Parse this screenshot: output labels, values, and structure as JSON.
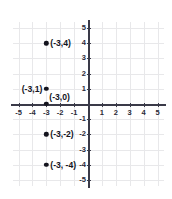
{
  "chart_data": {
    "type": "scatter",
    "title": "",
    "xlabel": "",
    "ylabel": "",
    "xlim": [
      -5,
      5
    ],
    "ylim": [
      -5,
      5
    ],
    "grid": true,
    "legend": null,
    "x_ticks": [
      "-5",
      "-4",
      "-3",
      "-2",
      "-1",
      "1",
      "2",
      "3",
      "4",
      "5"
    ],
    "x_tick_values": [
      -5,
      -4,
      -3,
      -2,
      -1,
      1,
      2,
      3,
      4,
      5
    ],
    "y_ticks": [
      "5",
      "4",
      "3",
      "2",
      "1",
      "-1",
      "-2",
      "-3",
      "-4",
      "-5"
    ],
    "y_tick_values": [
      5,
      4,
      3,
      2,
      1,
      -1,
      -2,
      -3,
      -4,
      -5
    ],
    "points": [
      {
        "x": -3,
        "y": 4,
        "label": "(-3,4)",
        "label_side": "right"
      },
      {
        "x": -3,
        "y": 1,
        "label": "(-3,1)",
        "label_side": "left"
      },
      {
        "x": -3,
        "y": 0,
        "label": "(-3,0)",
        "label_side": "above-right"
      },
      {
        "x": -3,
        "y": -2,
        "label": "(-3,-2)",
        "label_side": "right"
      },
      {
        "x": -3,
        "y": -4,
        "label": "(-3, -4)",
        "label_side": "right"
      }
    ],
    "point_color": "#14141e",
    "axis_color": "#3a3a48",
    "grid_color": "#e8e8ea",
    "background_color": "#ffffff"
  }
}
